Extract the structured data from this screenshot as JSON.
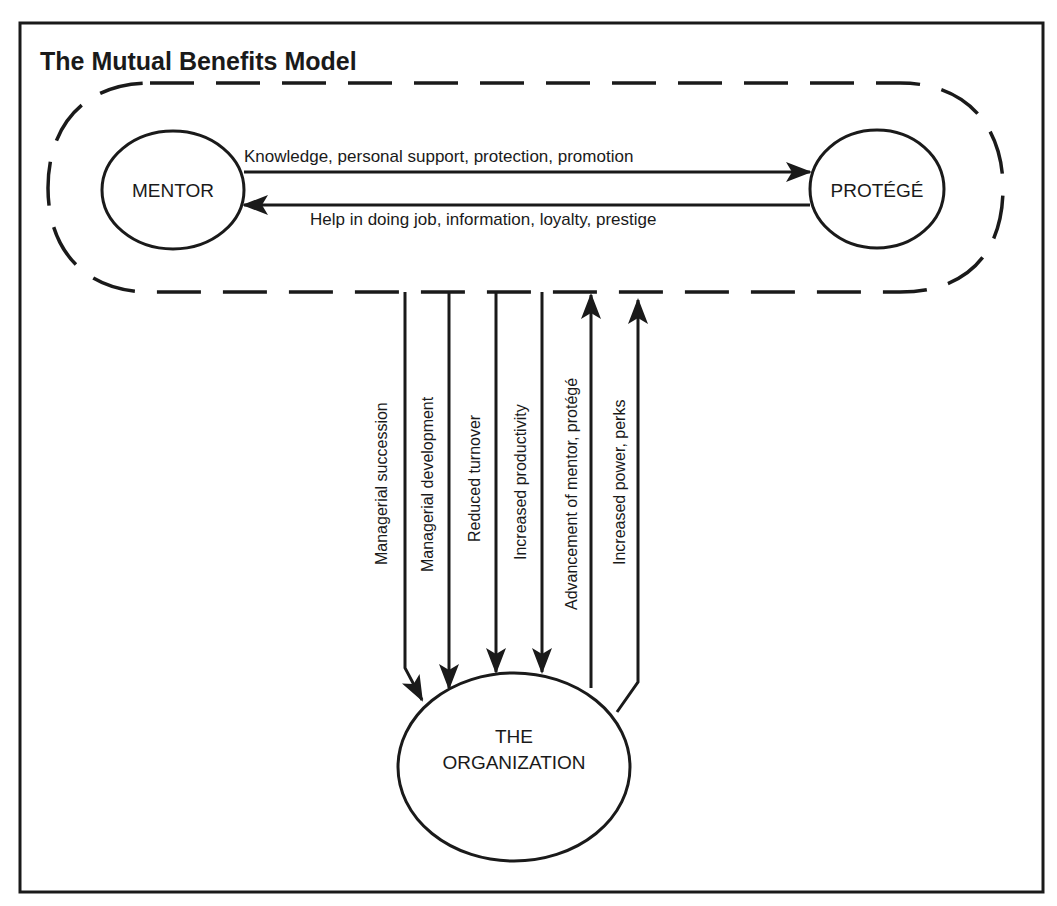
{
  "title": "The Mutual Benefits Model",
  "colors": {
    "ink": "#1a1a1a",
    "background": "#ffffff"
  },
  "nodes": {
    "mentor": "MENTOR",
    "protege": "PROTÉGÉ",
    "organization_line1": "THE",
    "organization_line2": "ORGANIZATION"
  },
  "horizontal_flows": {
    "mentor_to_protege": "Knowledge, personal support, protection, promotion",
    "protege_to_mentor": "Help in doing job, information, loyalty, prestige"
  },
  "vertical_flows": [
    {
      "label": "Managerial succession",
      "direction": "to-organization"
    },
    {
      "label": "Managerial development",
      "direction": "to-organization"
    },
    {
      "label": "Reduced turnover",
      "direction": "to-organization"
    },
    {
      "label": "Increased productivity",
      "direction": "to-organization"
    },
    {
      "label": "Advancement of mentor, protégé",
      "direction": "to-pair"
    },
    {
      "label": "Increased power, perks",
      "direction": "to-pair"
    }
  ]
}
